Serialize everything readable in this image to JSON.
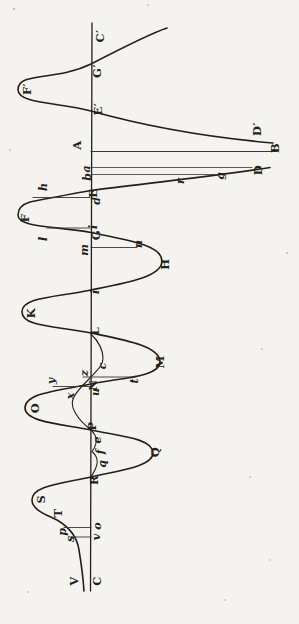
{
  "figure": {
    "canvas": {
      "width": 299,
      "height": 624
    },
    "colors": {
      "paper": "#f4f3ef",
      "ink": "#241f19",
      "hairline": "#3a352e",
      "speck": "#8d867c"
    },
    "axis_d": "M 92 23 L 90.5 591",
    "main_curve_d": "M 167 28 C 152 33 120 49 91 64 C 56 81 19 72 18 89 C 17 104 57 102 91 111 C 148 127 216 138 273 143 M 270 167.5 C 210 177 140 184 91 190.5 C 70 194 45 199 30 202 C 22 204.5 18 208 18 215 C 18 228 57 226 91 232.5 C 127 240 162 245 162 261 C 162 277 126 283 91 290 C 55 297.5 22 297 22 312 C 22 327 57 326 91 333 C 125 340 160 346 160 362 C 160 377 119 378 91 384 C 57 391 25 393 25 408 C 25 422 61 424 91 430 C 118 436 153 438 153 453 C 153 467 116 471 91 477 C 59 484 32 486 32 500 C 32 510 47 515 57 520 C 69 527 77 536 79 550 C 81 562 83 576 84 591",
    "inner_curve_d": "M 91 334 C 99 342 103 350 103 358 C 103 366 97 370 92 376 C 85 383 76 391 73 399 C 70 407 77 419 90 429 C 95 434 97 437 96 443 C 95 448 93 450 92 451.5 C 96 455 98 459 97 464 C 96 470 93 473 91 477",
    "stroke_widths": {
      "axis": 1.3,
      "main": 1.6,
      "inner": 1.1
    },
    "ordinate_lines": [
      {
        "name": "line-A-B",
        "x1": 91,
        "y1": 151.5,
        "x2": 277,
        "y2": 151.5,
        "w": 1.2
      },
      {
        "name": "line-a",
        "x1": 91,
        "y1": 167.5,
        "x2": 252,
        "y2": 167.5,
        "w": 0.8
      },
      {
        "name": "line-b",
        "x1": 91,
        "y1": 174.5,
        "x2": 222,
        "y2": 174.5,
        "w": 0.8
      },
      {
        "name": "line-h-d",
        "x1": 33,
        "y1": 197.5,
        "x2": 90,
        "y2": 197.5,
        "w": 0.9
      },
      {
        "name": "line-l-G",
        "x1": 47,
        "y1": 228,
        "x2": 90,
        "y2": 228,
        "w": 0.9
      },
      {
        "name": "line-m-n",
        "x1": 91,
        "y1": 247.5,
        "x2": 137,
        "y2": 247.5,
        "w": 0.9
      },
      {
        "name": "line-z-t",
        "x1": 83,
        "y1": 377,
        "x2": 136,
        "y2": 377,
        "w": 0.9
      },
      {
        "name": "line-y-N",
        "x1": 53,
        "y1": 386.5,
        "x2": 91,
        "y2": 386.5,
        "w": 0.9
      },
      {
        "name": "line-p-o",
        "x1": 64,
        "y1": 527.5,
        "x2": 91,
        "y2": 527.5,
        "w": 0.9
      },
      {
        "name": "line-s-v",
        "x1": 71,
        "y1": 537,
        "x2": 91,
        "y2": 537,
        "w": 0.9
      }
    ],
    "labels": [
      {
        "id": "C-prime",
        "text": "C′",
        "kind": "capital",
        "x": 101,
        "y": 36
      },
      {
        "id": "G-prime",
        "text": "G′",
        "kind": "capital",
        "x": 98,
        "y": 71
      },
      {
        "id": "F-prime",
        "text": "F′",
        "kind": "capital",
        "x": 28,
        "y": 89
      },
      {
        "id": "E-prime",
        "text": "E′",
        "kind": "capital",
        "x": 99,
        "y": 109
      },
      {
        "id": "D-prime",
        "text": "D′",
        "kind": "capital",
        "x": 258,
        "y": 129
      },
      {
        "id": "B",
        "text": "B",
        "kind": "capital",
        "x": 276,
        "y": 148
      },
      {
        "id": "A",
        "text": "A",
        "kind": "capital",
        "x": 78,
        "y": 145
      },
      {
        "id": "D",
        "text": "D",
        "kind": "capital",
        "x": 259,
        "y": 170
      },
      {
        "id": "a",
        "text": "a",
        "kind": "lower",
        "x": 86,
        "y": 169
      },
      {
        "id": "b",
        "text": "b",
        "kind": "lower",
        "x": 87,
        "y": 177
      },
      {
        "id": "g",
        "text": "g",
        "kind": "lower",
        "x": 220,
        "y": 176
      },
      {
        "id": "r",
        "text": "r",
        "kind": "lower",
        "x": 180,
        "y": 181
      },
      {
        "id": "h",
        "text": "h",
        "kind": "lower",
        "x": 43,
        "y": 187
      },
      {
        "id": "E",
        "text": "E",
        "kind": "capital",
        "x": 94,
        "y": 193
      },
      {
        "id": "d",
        "text": "d",
        "kind": "lower",
        "x": 96,
        "y": 201
      },
      {
        "id": "F",
        "text": "F",
        "kind": "capital",
        "x": 26,
        "y": 218
      },
      {
        "id": "i-1",
        "text": "i",
        "kind": "lower",
        "x": 93,
        "y": 227
      },
      {
        "id": "G",
        "text": "G",
        "kind": "capital",
        "x": 97,
        "y": 235
      },
      {
        "id": "l",
        "text": "l",
        "kind": "lower",
        "x": 43,
        "y": 239
      },
      {
        "id": "n",
        "text": "n",
        "kind": "lower",
        "x": 138,
        "y": 244
      },
      {
        "id": "m",
        "text": "m",
        "kind": "lower",
        "x": 84,
        "y": 250
      },
      {
        "id": "H",
        "text": "H",
        "kind": "capital",
        "x": 166,
        "y": 264
      },
      {
        "id": "i-2",
        "text": "i",
        "kind": "lower",
        "x": 95,
        "y": 292
      },
      {
        "id": "K",
        "text": "K",
        "kind": "capital",
        "x": 32,
        "y": 313
      },
      {
        "id": "L",
        "text": "L",
        "kind": "capital",
        "x": 96,
        "y": 331
      },
      {
        "id": "M",
        "text": "M",
        "kind": "capital",
        "x": 161,
        "y": 362
      },
      {
        "id": "c",
        "text": "c",
        "kind": "lower",
        "x": 102,
        "y": 366
      },
      {
        "id": "z",
        "text": "z",
        "kind": "lower",
        "x": 84,
        "y": 373
      },
      {
        "id": "t",
        "text": "t",
        "kind": "lower",
        "x": 134,
        "y": 381
      },
      {
        "id": "y",
        "text": "y",
        "kind": "lower",
        "x": 51,
        "y": 381
      },
      {
        "id": "N",
        "text": "N",
        "kind": "capital",
        "x": 94,
        "y": 385
      },
      {
        "id": "u",
        "text": "u",
        "kind": "lower",
        "x": 95,
        "y": 392
      },
      {
        "id": "x",
        "text": "x",
        "kind": "lower",
        "x": 70,
        "y": 396
      },
      {
        "id": "O",
        "text": "O",
        "kind": "capital",
        "x": 36,
        "y": 408
      },
      {
        "id": "P",
        "text": "P",
        "kind": "capital",
        "x": 93,
        "y": 426
      },
      {
        "id": "e",
        "text": "e",
        "kind": "lower",
        "x": 97,
        "y": 440
      },
      {
        "id": "f",
        "text": "f",
        "kind": "lower",
        "x": 100,
        "y": 452
      },
      {
        "id": "Q",
        "text": "Q",
        "kind": "capital",
        "x": 156,
        "y": 452
      },
      {
        "id": "q",
        "text": "q",
        "kind": "lower",
        "x": 102,
        "y": 464
      },
      {
        "id": "R",
        "text": "R",
        "kind": "capital",
        "x": 95,
        "y": 480
      },
      {
        "id": "S",
        "text": "S",
        "kind": "capital",
        "x": 42,
        "y": 499
      },
      {
        "id": "T",
        "text": "T",
        "kind": "capital",
        "x": 59,
        "y": 513
      },
      {
        "id": "o",
        "text": "o",
        "kind": "lower",
        "x": 97,
        "y": 526
      },
      {
        "id": "v",
        "text": "v",
        "kind": "lower",
        "x": 96,
        "y": 537
      },
      {
        "id": "p",
        "text": "p",
        "kind": "lower",
        "x": 62,
        "y": 532
      },
      {
        "id": "s",
        "text": "s",
        "kind": "lower",
        "x": 70,
        "y": 539
      },
      {
        "id": "V",
        "text": "V",
        "kind": "capital",
        "x": 75,
        "y": 581
      },
      {
        "id": "C",
        "text": "C",
        "kind": "capital",
        "x": 98,
        "y": 581
      }
    ],
    "speckles": [
      {
        "x": 14,
        "y": 9,
        "r": 1.2
      },
      {
        "x": 148,
        "y": 5,
        "r": 1.0
      },
      {
        "x": 10,
        "y": 150,
        "r": 1.0
      },
      {
        "x": 287,
        "y": 253,
        "r": 1.1
      },
      {
        "x": 262,
        "y": 349,
        "r": 1.0
      },
      {
        "x": 250,
        "y": 477,
        "r": 1.0
      },
      {
        "x": 270,
        "y": 560,
        "r": 0.9
      },
      {
        "x": 28,
        "y": 592,
        "r": 1.0
      },
      {
        "x": 225,
        "y": 600,
        "r": 1.0
      }
    ]
  }
}
